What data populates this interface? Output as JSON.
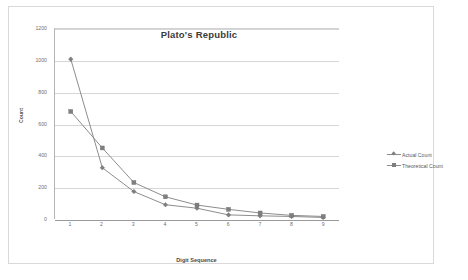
{
  "chart_data": {
    "type": "line",
    "title": "Plato's Republic",
    "xlabel": "Digit Sequence",
    "ylabel": "Count",
    "categories": [
      "1",
      "2",
      "3",
      "4",
      "5",
      "6",
      "7",
      "8",
      "9"
    ],
    "x": [
      1,
      2,
      3,
      4,
      5,
      6,
      7,
      8,
      9
    ],
    "series": [
      {
        "name": "Actual Count",
        "marker": "diamond",
        "color": "#808080",
        "values": [
          1010,
          325,
          175,
          92,
          70,
          28,
          22,
          18,
          12
        ]
      },
      {
        "name": "Theoretical Count",
        "marker": "square",
        "color": "#808080",
        "values": [
          680,
          450,
          232,
          142,
          90,
          63,
          40,
          25,
          18
        ]
      }
    ],
    "ylim": [
      0,
      1200
    ],
    "yticks": [
      0,
      200,
      400,
      600,
      800,
      1000,
      1200
    ],
    "ytick_labels": [
      "0",
      "200",
      "400",
      "600",
      "800",
      "1000",
      "1200"
    ],
    "xlim": [
      0.5,
      9.5
    ],
    "grid": true,
    "grid_axis": "y",
    "legend_position": "right",
    "plot_background": "#ffffff",
    "gridline_color": "#d6d6d6",
    "axis_color": "#9a9a9a",
    "border_color": "#d9d9d9"
  },
  "legend": {
    "entries": [
      {
        "label": "Actual Count"
      },
      {
        "label": "Theoretical Count"
      }
    ]
  }
}
